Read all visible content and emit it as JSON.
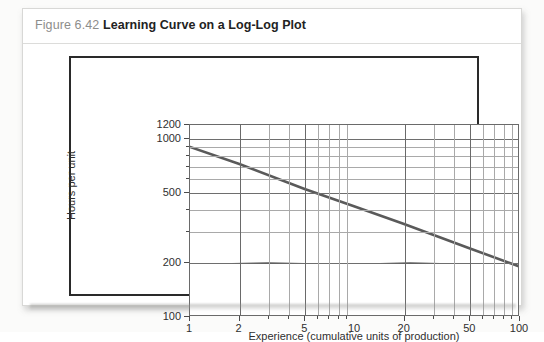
{
  "figure": {
    "number": "Figure 6.42",
    "title": "Learning Curve on a Log-Log Plot"
  },
  "chart_data": {
    "type": "line",
    "title": "Learning Curve on a Log-Log Plot",
    "xlabel": "Experience (cumulative units of production)",
    "ylabel": "Hours per unit",
    "xscale": "log",
    "yscale": "log",
    "xlim": [
      1,
      100
    ],
    "ylim": [
      100,
      1200
    ],
    "grid": true,
    "legend": "none",
    "xticks": [
      1,
      2,
      5,
      10,
      20,
      50,
      100
    ],
    "xticklabels": [
      "1",
      "2",
      "5",
      "10",
      "20",
      "50",
      "100"
    ],
    "yticks": [
      100,
      200,
      500,
      1000,
      1200
    ],
    "yticklabels": [
      "100",
      "200",
      "500",
      "1000",
      "1200"
    ],
    "series": [
      {
        "name": "Learning curve",
        "color": "#5a5a5a",
        "x": [
          1,
          2,
          5,
          10,
          20,
          50,
          100
        ],
        "y": [
          900,
          720,
          520,
          415,
          330,
          240,
          190
        ]
      }
    ]
  },
  "axes": {
    "x_ticks": [
      {
        "label": "1",
        "value": 1
      },
      {
        "label": "2",
        "value": 2
      },
      {
        "label": "5",
        "value": 5
      },
      {
        "label": "10",
        "value": 10
      },
      {
        "label": "20",
        "value": 20
      },
      {
        "label": "50",
        "value": 50
      },
      {
        "label": "100",
        "value": 100
      }
    ],
    "y_ticks": [
      {
        "label": "1200",
        "value": 1200
      },
      {
        "label": "1000",
        "value": 1000
      },
      {
        "label": "500",
        "value": 500
      },
      {
        "label": "200",
        "value": 200
      },
      {
        "label": "100",
        "value": 100
      }
    ],
    "x_title": "Experience (cumulative units of production)",
    "y_title": "Hours per unit"
  }
}
